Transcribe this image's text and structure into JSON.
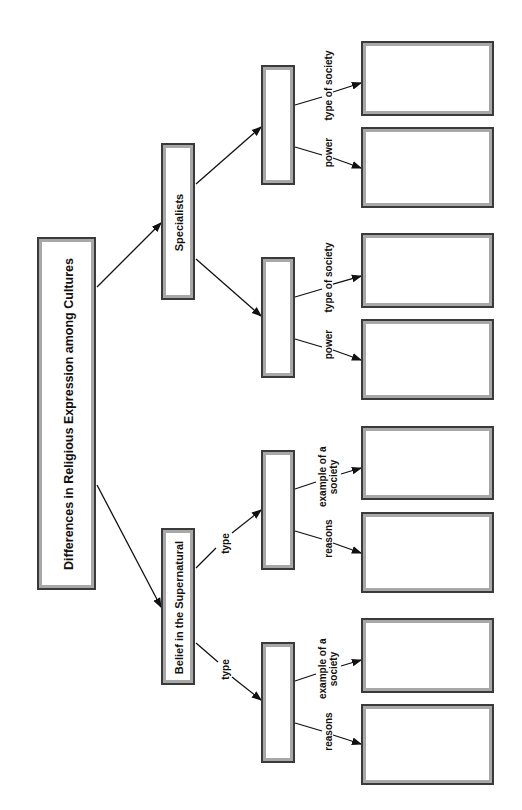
{
  "diagram": {
    "title": "Differences in Religious Expression among Cultures",
    "branches": [
      {
        "label": "Belief in the Supernatural",
        "edge_label": "",
        "children": [
          {
            "edge_label": "type",
            "value": "",
            "leaves": [
              {
                "edge_label": "reasons",
                "value": ""
              },
              {
                "edge_label": "example of a society",
                "value": ""
              }
            ]
          },
          {
            "edge_label": "type",
            "value": "",
            "leaves": [
              {
                "edge_label": "reasons",
                "value": ""
              },
              {
                "edge_label": "example of a society",
                "value": ""
              }
            ]
          }
        ]
      },
      {
        "label": "Specialists",
        "edge_label": "",
        "children": [
          {
            "edge_label": "",
            "value": "",
            "leaves": [
              {
                "edge_label": "power",
                "value": ""
              },
              {
                "edge_label": "type of society",
                "value": ""
              }
            ]
          },
          {
            "edge_label": "",
            "value": "",
            "leaves": [
              {
                "edge_label": "power",
                "value": ""
              },
              {
                "edge_label": "type of society",
                "value": ""
              }
            ]
          }
        ]
      }
    ],
    "labels": {
      "type": "type",
      "reasons": "reasons",
      "example_line1": "example of a",
      "example_line2": "society",
      "power": "power",
      "type_of_society": "type of society"
    },
    "colors": {
      "border_dark": "#3a3a3a",
      "border_light": "#a8a8a8",
      "line": "#111111"
    }
  }
}
